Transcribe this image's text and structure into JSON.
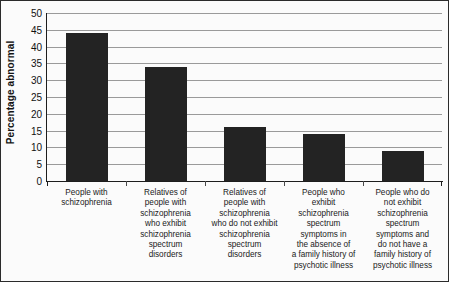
{
  "chart_data": {
    "type": "bar",
    "title": "",
    "xlabel": "",
    "ylabel": "Percentage abnormal",
    "ylim": [
      0,
      50
    ],
    "ytick_step": 5,
    "yticks": [
      50,
      45,
      40,
      35,
      30,
      25,
      20,
      15,
      10,
      5,
      0
    ],
    "grid": true,
    "legend": "none",
    "bar_color": "#232323",
    "gridline_color": "#9a9a9a",
    "background_color": "#fbfbfb",
    "border_color": "#2b2b2b",
    "categories": [
      "People with schizophrenia",
      "Relatives of people with schizophrenia who exhibit schizophrenia spectrum disorders",
      "Relatives of people with schizophrenia who do not exhibit schizophrenia spectrum disorders",
      "People who exhibit schizophrenia spectrum symptoms in the absence of a family history of psychotic illness",
      "People who do not exhibit schizophrenia spectrum symptoms and do not have a family history of psychotic illness"
    ],
    "category_label_lines": [
      [
        "People with",
        "schizophrenia"
      ],
      [
        "Relatives of",
        "people with",
        "schizophrenia",
        "who exhibit",
        "schizophrenia",
        "spectrum",
        "disorders"
      ],
      [
        "Relatives of",
        "people with",
        "schizophrenia",
        "who do not exhibit",
        "schizophrenia",
        "spectrum",
        "disorders"
      ],
      [
        "People who",
        "exhibit",
        "schizophrenia",
        "spectrum",
        "symptoms in",
        "the absence of",
        "a family history of",
        "psychotic illness"
      ],
      [
        "People who do",
        "not exhibit",
        "schizophrenia",
        "spectrum",
        "symptoms and",
        "do not have a",
        "family history of",
        "psychotic illness"
      ]
    ],
    "values": [
      44,
      34,
      16,
      14,
      9
    ]
  }
}
